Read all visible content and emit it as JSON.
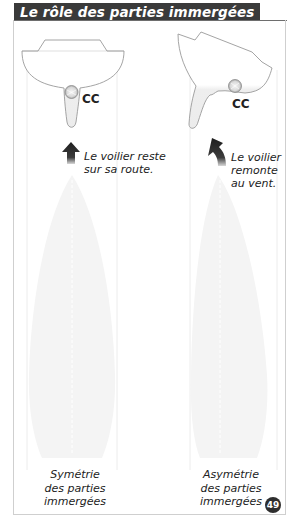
{
  "title": "Le rôle des parties immergées",
  "left_panel": {
    "center_label": "CC",
    "caption_lines": [
      "Le voilier reste",
      "sur sa route."
    ],
    "bottom_lines": [
      "Symétrie",
      "des parties",
      "immergées"
    ],
    "arrow": "arrow-up-icon"
  },
  "right_panel": {
    "center_label": "CC",
    "caption_lines": [
      "Le voilier",
      "remonte",
      "au vent."
    ],
    "bottom_lines": [
      "Asymétrie",
      "des parties",
      "immergées"
    ],
    "arrow": "arrow-up-left-curved-icon"
  },
  "page_number": "49",
  "colors": {
    "title_bg": "#3a3a3a",
    "title_text": "#ffffff",
    "hull_fill": "#f1f1f1",
    "hull_stroke": "#9a9a9a",
    "arrow": "#2b2b2b",
    "badge": "#2e2e2e"
  }
}
